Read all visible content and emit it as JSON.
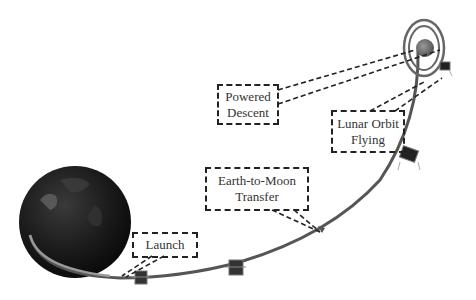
{
  "diagram": {
    "labels": {
      "launch": "Launch",
      "transfer_line1": "Earth-to-Moon",
      "transfer_line2": "Transfer",
      "lunar_orbit_line1": "Lunar Orbit",
      "lunar_orbit_line2": "Flying",
      "powered_descent_line1": "Powered",
      "powered_descent_line2": "Descent"
    },
    "elements": [
      "earth",
      "moon",
      "lunar-orbit-rings",
      "trajectory",
      "spacecraft-1",
      "spacecraft-2",
      "spacecraft-3",
      "lander"
    ],
    "colors": {
      "trajectory": "#555555",
      "earth": "#1c1c1c",
      "moon": "#777777",
      "dashes": "#222222"
    }
  }
}
